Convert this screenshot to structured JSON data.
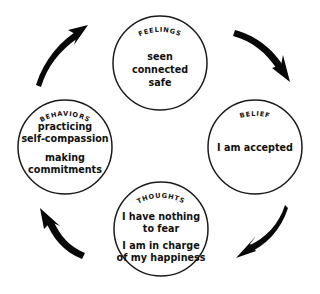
{
  "diagram": {
    "background_color": "#ffffff",
    "stroke_color": "#1b1b1b",
    "arrow_color": "#080808",
    "direction": "clockwise",
    "nodes": [
      {
        "id": "feelings",
        "label": "FEELINGS",
        "lines": [
          "seen",
          "connected",
          "safe"
        ],
        "cx": 160,
        "cy": 63,
        "r": 47
      },
      {
        "id": "belief",
        "label": "BELIEF",
        "lines": [
          "I am accepted"
        ],
        "cx": 255,
        "cy": 147,
        "r": 47
      },
      {
        "id": "thoughts",
        "label": "THOUGHTS",
        "lines": [
          "I have nothing",
          "to fear",
          "I am in charge",
          "of my happiness"
        ],
        "cx": 161,
        "cy": 229,
        "r": 47
      },
      {
        "id": "behaviors",
        "label": "BEHAVIORS",
        "lines": [
          "practicing",
          "self-compassion",
          "making",
          "commitments"
        ],
        "cx": 65,
        "cy": 147,
        "r": 47
      }
    ],
    "arrows": [
      {
        "id": "behaviors-to-feelings",
        "from": "behaviors",
        "to": "feelings",
        "name": "arrow-behaviors-to-feelings"
      },
      {
        "id": "feelings-to-belief",
        "from": "feelings",
        "to": "belief",
        "name": "arrow-feelings-to-belief"
      },
      {
        "id": "belief-to-thoughts",
        "from": "belief",
        "to": "thoughts",
        "name": "arrow-belief-to-thoughts"
      },
      {
        "id": "thoughts-to-behaviors",
        "from": "thoughts",
        "to": "behaviors",
        "name": "arrow-thoughts-to-behaviors"
      }
    ]
  }
}
